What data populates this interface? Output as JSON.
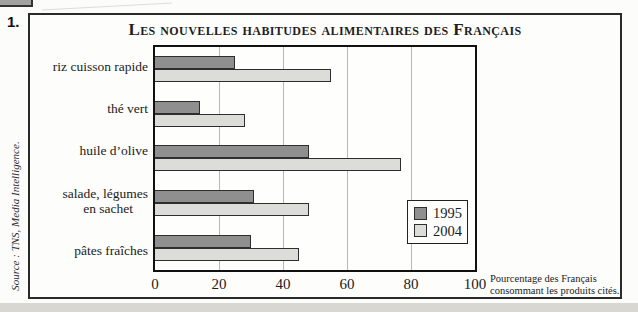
{
  "page": {
    "exercise_number": "1.",
    "source_credit": "Source : TNS, Media Intelligence."
  },
  "chart": {
    "note": {
      "line1": "Pourcentage des Français",
      "line2": "consommant les produits cités."
    },
    "legend": [
      {
        "label": "1995",
        "color": "#8f8f8f"
      },
      {
        "label": "2004",
        "color": "#dcdcd8"
      }
    ],
    "colors": {
      "grid": "#b8b8b6",
      "bar_border": "#2e2e2e",
      "frame": "#111111"
    }
  },
  "chart_data": {
    "type": "bar",
    "orientation": "horizontal",
    "title": "Les nouvelles habitudes alimentaires des Français",
    "categories": [
      "riz cuisson rapide",
      "thé vert",
      "huile d’olive",
      "salade, légumes en sachet",
      "pâtes fraîches"
    ],
    "category_lines": [
      [
        "riz cuisson rapide"
      ],
      [
        "thé vert"
      ],
      [
        "huile d’olive"
      ],
      [
        "salade, légumes",
        "en sachet"
      ],
      [
        "pâtes fraîches"
      ]
    ],
    "series": [
      {
        "name": "1995",
        "values": [
          25,
          14,
          48,
          31,
          30
        ]
      },
      {
        "name": "2004",
        "values": [
          55,
          28,
          77,
          48,
          45
        ]
      }
    ],
    "xlabel": "Pourcentage des Français consommant les produits cités.",
    "xlim": [
      0,
      100
    ],
    "xticks": [
      0,
      20,
      40,
      60,
      80,
      100
    ],
    "grid": "vertical",
    "legend_position": "inside-bottom-right"
  }
}
